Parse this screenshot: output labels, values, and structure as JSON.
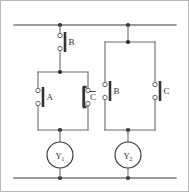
{
  "figure": {
    "background_color": "#ffffff",
    "wire_color": "#6b6b6b",
    "contact_color": "#333333",
    "node_color": "#2b2b2b",
    "width": 189,
    "height": 192
  },
  "rails": {
    "top": {
      "label": "top-power-rail",
      "y": 25,
      "x_start": 14,
      "x_end": 176
    },
    "bottom": {
      "label": "bottom-power-rail",
      "y": 178,
      "x_start": 14,
      "x_end": 176
    }
  },
  "branches": [
    {
      "id": "branch-1",
      "rail_x": 60,
      "series_contact": {
        "label": "B",
        "type": "normally-open",
        "overline": false
      },
      "parallel_contacts": [
        {
          "label": "A",
          "type": "normally-open",
          "overline": false
        },
        {
          "label": "C",
          "type": "normally-closed",
          "overline": true
        }
      ],
      "coil": {
        "label": "Y",
        "subscript": "1",
        "type": "relay-coil"
      }
    },
    {
      "id": "branch-2",
      "rail_x": 128,
      "series_contact": null,
      "parallel_contacts": [
        {
          "label": "B",
          "type": "normally-open",
          "overline": false
        },
        {
          "label": "C",
          "type": "normally-open",
          "overline": false
        }
      ],
      "coil": {
        "label": "Y",
        "subscript": "2",
        "type": "relay-coil"
      }
    }
  ],
  "labels": {
    "contact_b_top": "B",
    "contact_a": "A",
    "contact_c_bar": "C",
    "contact_b_right": "B",
    "contact_c_right": "C",
    "coil_y1": "Y",
    "coil_y1_sub": "1",
    "coil_y2": "Y",
    "coil_y2_sub": "2"
  }
}
